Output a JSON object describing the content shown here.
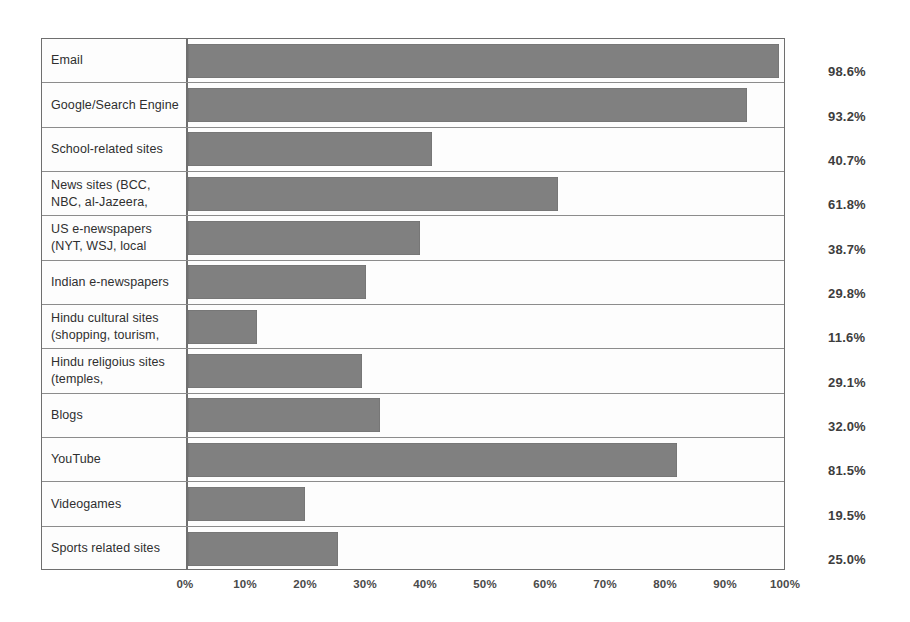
{
  "chart_data": {
    "type": "bar",
    "orientation": "horizontal",
    "title": "",
    "subtitle": "",
    "xlabel": "",
    "ylabel": "",
    "xlim": [
      0,
      100
    ],
    "grid": false,
    "legend": null,
    "bar_color": "#808080",
    "axis_tick_labels": [
      "0%",
      "10%",
      "20%",
      "30%",
      "40%",
      "50%",
      "60%",
      "70%",
      "80%",
      "90%",
      "100%"
    ],
    "axis_tick_values": [
      0,
      10,
      20,
      30,
      40,
      50,
      60,
      70,
      80,
      90,
      100
    ],
    "categories": [
      "Email",
      "Google/Search Engine",
      "School-related sites",
      "News sites (BCC, NBC, al-Jazeera,",
      "US e-newspapers (NYT, WSJ, local",
      "Indian e-newspapers",
      "Hindu cultural sites (shopping, tourism,",
      "Hindu religoius sites (temples,",
      "Blogs",
      "YouTube",
      "Videogames",
      "Sports related sites"
    ],
    "values": [
      98.6,
      93.2,
      40.7,
      61.8,
      38.7,
      29.8,
      11.6,
      29.1,
      32.0,
      81.5,
      19.5,
      25.0
    ],
    "value_labels": [
      "98.6%",
      "93.2%",
      "40.7%",
      "61.8%",
      "38.7%",
      "29.8%",
      "11.6%",
      "29.1%",
      "32.0%",
      "81.5%",
      "19.5%",
      "25.0%"
    ]
  }
}
